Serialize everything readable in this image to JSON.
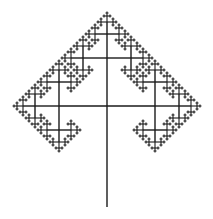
{
  "figure": {
    "stroke_color": "#1a1a1a",
    "background": "#ffffff",
    "center": [
      107,
      106
    ],
    "trunk_bottom": 207,
    "initial_arm": 48,
    "scale": 0.5,
    "depth": 5
  }
}
